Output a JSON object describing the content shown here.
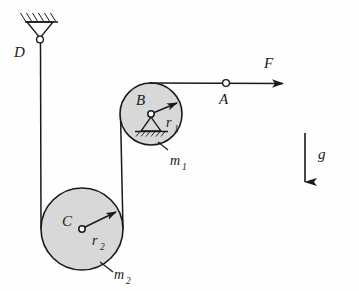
{
  "figure": {
    "type": "mechanics-diagram",
    "background_color": "#fefefe",
    "stroke_color": "#1a1a1a",
    "disk_fill_color": "#d6d6d6"
  },
  "labels": {
    "support_d": "D",
    "pulley_b": "B",
    "pulley_c": "C",
    "point_a": "A",
    "force_f": "F",
    "gravity_g": "g",
    "radius_1": "r",
    "radius_1_sub": "1",
    "radius_2": "r",
    "radius_2_sub": "2",
    "mass_1": "m",
    "mass_1_sub": "1",
    "mass_2": "m",
    "mass_2_sub": "2"
  },
  "geometry": {
    "pulley_b": {
      "cx": 151,
      "cy": 114,
      "r": 31
    },
    "pulley_c": {
      "cx": 82,
      "cy": 229,
      "r": 41
    },
    "support_d": {
      "x": 40,
      "y": 38
    },
    "point_a": {
      "x": 225,
      "y": 83
    },
    "force_arrow": {
      "x1": 151,
      "y1": 83,
      "x2": 285,
      "y2": 83
    },
    "gravity_arrow": {
      "x": 305,
      "y1": 133,
      "y2": 190
    },
    "cord_left": {
      "x": 40,
      "y1": 42,
      "y2": 229
    },
    "cord_right": {
      "x": 123,
      "y1": 114,
      "y2": 229
    }
  }
}
